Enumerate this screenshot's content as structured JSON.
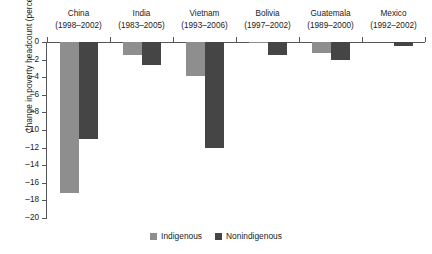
{
  "chart_data": {
    "type": "bar",
    "title": "",
    "xlabel": "",
    "ylabel": "Change in poverty headcount (percent)",
    "ylim": [
      -20,
      0
    ],
    "ytick_step": 2,
    "grid": false,
    "legend_position": "bottom",
    "categories": [
      "China",
      "India",
      "Vietnam",
      "Bolivia",
      "Guatemala",
      "Mexico"
    ],
    "category_periods": [
      "(1998–2002)",
      "(1983–2005)",
      "(1993–2006)",
      "(1997–2002)",
      "(1989–2000)",
      "(1992–2002)"
    ],
    "series": [
      {
        "name": "Indigenous",
        "color": "#8e8e8e",
        "values": [
          -17.2,
          -1.5,
          -3.9,
          -0.1,
          -1.2,
          0.0
        ]
      },
      {
        "name": "Nonindigenous",
        "color": "#454545",
        "values": [
          -11.0,
          -2.6,
          -12.0,
          -1.5,
          -2.0,
          -0.5
        ]
      }
    ],
    "ytick_labels": [
      "0",
      "–2",
      "–4",
      "–6",
      "–8",
      "–10",
      "–12",
      "–14",
      "–16",
      "–18",
      "–20"
    ],
    "ytick_values": [
      0,
      -2,
      -4,
      -6,
      -8,
      -10,
      -12,
      -14,
      -16,
      -18,
      -20
    ],
    "axis_color": "#55565a",
    "background_color": "#ffffff"
  },
  "legend": {
    "items": [
      {
        "label": "Indigenous",
        "key": "indigenous"
      },
      {
        "label": "Nonindigenous",
        "key": "nonindigenous"
      }
    ]
  }
}
